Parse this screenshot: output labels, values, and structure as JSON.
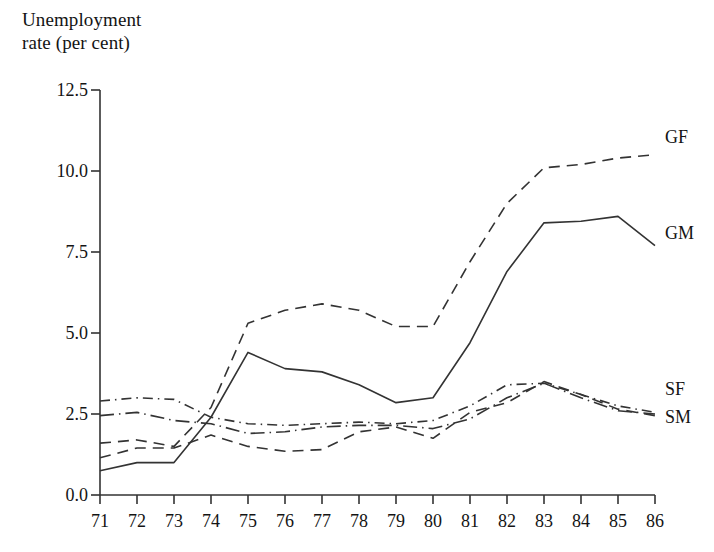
{
  "figure": {
    "axis_title": "Unemployment\nrate (per cent)",
    "background_color": "#ffffff",
    "line_color": "#333333"
  },
  "chart_data": {
    "type": "line",
    "title": "Unemployment rate (per cent)",
    "xlabel": "",
    "ylabel": "Unemployment rate (per cent)",
    "x": [
      71,
      72,
      73,
      74,
      75,
      76,
      77,
      78,
      79,
      80,
      81,
      82,
      83,
      84,
      85,
      86
    ],
    "categories": [
      "71",
      "72",
      "73",
      "74",
      "75",
      "76",
      "77",
      "78",
      "79",
      "80",
      "81",
      "82",
      "83",
      "84",
      "85",
      "86"
    ],
    "xlim": [
      71,
      86
    ],
    "ylim": [
      0.0,
      12.5
    ],
    "yticks": [
      0.0,
      2.5,
      5.0,
      7.5,
      10.0,
      12.5
    ],
    "ytick_labels": [
      "0.0",
      "2.5",
      "5.0",
      "7.5",
      "10.0",
      "12.5"
    ],
    "grid": false,
    "legend_position": "right-inline-labels",
    "series": [
      {
        "name": "GF",
        "label": "GF",
        "style": "dashed",
        "color": "#333333",
        "values": [
          1.6,
          1.7,
          1.5,
          2.7,
          5.3,
          5.7,
          5.9,
          5.7,
          5.2,
          5.2,
          7.2,
          9.0,
          10.1,
          10.2,
          10.4,
          10.5
        ]
      },
      {
        "name": "GM",
        "label": "GM",
        "style": "solid",
        "color": "#333333",
        "values": [
          0.75,
          1.0,
          1.0,
          2.4,
          4.4,
          3.9,
          3.8,
          3.4,
          2.85,
          3.0,
          4.7,
          6.9,
          8.4,
          8.45,
          8.6,
          7.7
        ]
      },
      {
        "name": "SF",
        "label": "SF",
        "style": "dashdot",
        "color": "#333333",
        "values": [
          2.9,
          3.0,
          2.95,
          2.4,
          2.2,
          2.15,
          2.2,
          2.25,
          2.2,
          2.3,
          2.75,
          3.4,
          3.45,
          3.1,
          2.75,
          2.55
        ]
      },
      {
        "name": "SM",
        "label": "SM",
        "style": "dashdot-long",
        "color": "#333333",
        "values": [
          2.45,
          2.55,
          2.3,
          2.2,
          1.9,
          1.95,
          2.1,
          2.15,
          2.15,
          2.05,
          2.35,
          3.0,
          3.45,
          3.0,
          2.6,
          2.5
        ]
      },
      {
        "name": "GF-low",
        "label": "",
        "style": "dashed",
        "color": "#333333",
        "values": [
          1.15,
          1.45,
          1.45,
          1.85,
          1.5,
          1.35,
          1.4,
          1.95,
          2.1,
          1.75,
          2.55,
          2.85,
          3.5,
          3.1,
          2.65,
          2.45
        ]
      }
    ],
    "annotations": [
      {
        "text": "GF",
        "x": 86,
        "y": 10.5,
        "position": "right"
      },
      {
        "text": "GM",
        "x": 86,
        "y": 7.7,
        "position": "right"
      },
      {
        "text": "SF",
        "x": 86,
        "y": 2.55,
        "position": "right"
      },
      {
        "text": "SM",
        "x": 86,
        "y": 2.5,
        "position": "right"
      }
    ]
  },
  "y_axis": {
    "labels": [
      "12.5",
      "10.0",
      "7.5",
      "5.0",
      "2.5",
      "0.0"
    ],
    "values": [
      12.5,
      10.0,
      7.5,
      5.0,
      2.5,
      0.0
    ]
  },
  "x_axis": {
    "labels": [
      "71",
      "72",
      "73",
      "74",
      "75",
      "76",
      "77",
      "78",
      "79",
      "80",
      "81",
      "82",
      "83",
      "84",
      "85",
      "86"
    ]
  },
  "series_labels": [
    {
      "text": "GF",
      "top": 137
    },
    {
      "text": "GM",
      "top": 233
    },
    {
      "text": "SF",
      "top": 389
    },
    {
      "text": "SM",
      "top": 417
    }
  ]
}
